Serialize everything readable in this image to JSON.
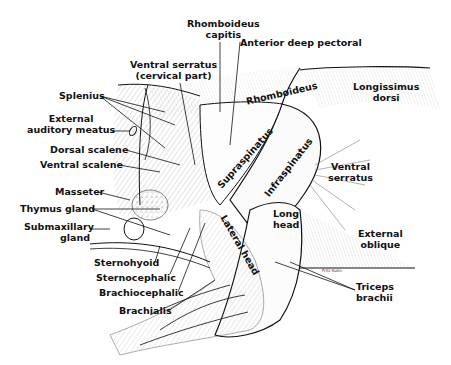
{
  "figure": {
    "ink_color": "#111111",
    "background": "#ffffff",
    "signature": "Fritz Kuhn"
  },
  "labels": {
    "rhomboideus_capitis": [
      "Rhomboideus",
      "capitis"
    ],
    "anterior_deep_pectoral": "Anterior deep pectoral",
    "ventral_serratus_cervical": [
      "Ventral serratus",
      "(cervical part)"
    ],
    "splenius": "Splenius",
    "external_auditory_meatus": [
      "External",
      "auditory meatus"
    ],
    "dorsal_scalene": "Dorsal scalene",
    "ventral_scalene": "Ventral scalene",
    "masseter": "Masseter",
    "thymus_gland": "Thymus gland",
    "submaxillary_gland": [
      "Submaxillary",
      "gland"
    ],
    "sternohyoid": "Sternohyoid",
    "sternocephalic": "Sternocephalic",
    "brachiocephalic": "Brachiocephalic",
    "brachialis": "Brachialis",
    "rhomboideus": "Rhomboideus",
    "longissimus_dorsi": [
      "Longissimus",
      "dorsi"
    ],
    "supraspinatus": "Supraspinatus",
    "infraspinatus": "Infraspinatus",
    "ventral_serratus": [
      "Ventral",
      "serratus"
    ],
    "long_head": [
      "Long",
      "head"
    ],
    "lateral_head": "Lateral head",
    "external_oblique": [
      "External",
      "oblique"
    ],
    "triceps_brachii": [
      "Triceps",
      "brachii"
    ]
  }
}
